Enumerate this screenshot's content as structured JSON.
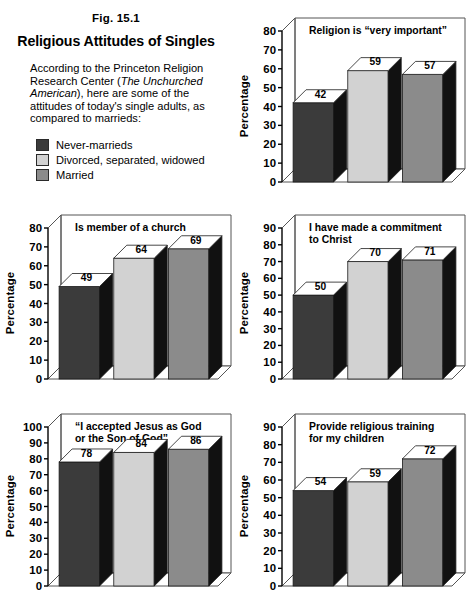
{
  "figure": {
    "number": "Fig. 15.1",
    "title": "Religious Attitudes of Singles",
    "description_part1": "According to the Princeton Religion Research Center (",
    "description_italic": "The Unchurched American",
    "description_part2": "), here are some of the attitudes of today's single adults, as compared to marrieds:"
  },
  "legend": {
    "items": [
      {
        "label": "Never-marrieds",
        "color": "#3b3b3b"
      },
      {
        "label": "Divorced, separated, widowed",
        "color": "#d2d2d2"
      },
      {
        "label": "Married",
        "color": "#8b8b8b"
      }
    ]
  },
  "colors": {
    "never_married": "#3b3b3b",
    "divorced": "#d2d2d2",
    "married": "#8b8b8b",
    "side_face": "#111111",
    "top_face": "#ffffff",
    "axis": "#000000",
    "frame": "#555555"
  },
  "chart_data": [
    {
      "id": "religion-very-important",
      "type": "bar",
      "title": "Religion is “very important”",
      "title_lines": [
        "Religion is “very important”"
      ],
      "ylabel": "Percentage",
      "xlabel": "",
      "ylim": [
        0,
        80
      ],
      "ystep": 10,
      "yticks": [
        0,
        10,
        20,
        30,
        40,
        50,
        60,
        70,
        80
      ],
      "grid": false,
      "legend_position": "external",
      "categories": [
        "Never-marrieds",
        "Divorced, separated, widowed",
        "Married"
      ],
      "values": [
        42,
        59,
        57
      ]
    },
    {
      "id": "member-of-church",
      "type": "bar",
      "title": "Is member of a church",
      "title_lines": [
        "Is member of a church"
      ],
      "ylabel": "Percentage",
      "xlabel": "",
      "ylim": [
        0,
        80
      ],
      "ystep": 10,
      "yticks": [
        0,
        10,
        20,
        30,
        40,
        50,
        60,
        70,
        80
      ],
      "grid": false,
      "legend_position": "external",
      "categories": [
        "Never-marrieds",
        "Divorced, separated, widowed",
        "Married"
      ],
      "values": [
        49,
        64,
        69
      ]
    },
    {
      "id": "commitment-to-christ",
      "type": "bar",
      "title": "I have made a commitment to Christ",
      "title_lines": [
        "I have made a commitment",
        "to Christ"
      ],
      "ylabel": "Percentage",
      "xlabel": "",
      "ylim": [
        0,
        90
      ],
      "ystep": 10,
      "yticks": [
        0,
        10,
        20,
        30,
        40,
        50,
        60,
        70,
        80,
        90
      ],
      "grid": false,
      "legend_position": "external",
      "categories": [
        "Never-marrieds",
        "Divorced, separated, widowed",
        "Married"
      ],
      "values": [
        50,
        70,
        71
      ]
    },
    {
      "id": "accepted-jesus",
      "type": "bar",
      "title": "“I accepted Jesus as God or the Son of God”",
      "title_lines": [
        "“I accepted Jesus as God",
        "or the Son of God”"
      ],
      "ylabel": "Percentage",
      "xlabel": "",
      "ylim": [
        0,
        100
      ],
      "ystep": 10,
      "yticks": [
        0,
        10,
        20,
        30,
        40,
        50,
        60,
        70,
        80,
        90,
        100
      ],
      "grid": false,
      "legend_position": "external",
      "categories": [
        "Never-marrieds",
        "Divorced, separated, widowed",
        "Married"
      ],
      "values": [
        78,
        84,
        86
      ]
    },
    {
      "id": "religious-training-children",
      "type": "bar",
      "title": "Provide religious training for my children",
      "title_lines": [
        "Provide religious training",
        "for my children"
      ],
      "ylabel": "Percentage",
      "xlabel": "",
      "ylim": [
        0,
        90
      ],
      "ystep": 10,
      "yticks": [
        0,
        10,
        20,
        30,
        40,
        50,
        60,
        70,
        80,
        90
      ],
      "grid": false,
      "legend_position": "external",
      "categories": [
        "Never-marrieds",
        "Divorced, separated, widowed",
        "Married"
      ],
      "values": [
        54,
        59,
        72
      ]
    }
  ]
}
